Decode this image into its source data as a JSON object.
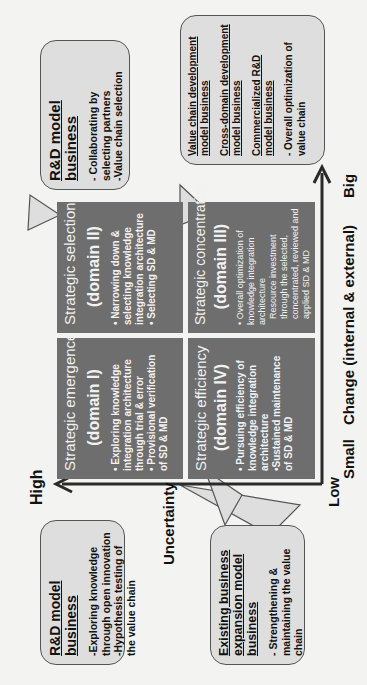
{
  "axes": {
    "y_axis": {
      "title": "Uncertainty",
      "high_label": "High",
      "low_label": "Low"
    },
    "x_axis": {
      "title": "Change (internal & external)",
      "small_label": "Small",
      "big_label": "Big"
    }
  },
  "domains": [
    {
      "id": "I",
      "title": "Strategic emergence",
      "subtitle": "(domain I)",
      "bullets": [
        "• Exploring knowledge integration architecture through trial & error",
        "• Provisional verification of SD & MD"
      ]
    },
    {
      "id": "II",
      "title": "Strategic selection",
      "subtitle": "(domain II)",
      "bullets": [
        "• Narrowing down & selecting knowledge integration architecture",
        "• Selecting SD & MD"
      ]
    },
    {
      "id": "III",
      "title": "Strategic concentration",
      "subtitle": "(domain III)",
      "bullets": [
        "• Overall optimization of knowledge integration architecture",
        "Resource investment through the selected, concentrated, reviewed and applied SD & MD"
      ]
    },
    {
      "id": "IV",
      "title": "Strategic efficiency",
      "subtitle": "(domain IV)",
      "bullets": [
        "• Pursuing efficiency of knowledge integration architecture",
        "•Sustained maintenance of SD & MD"
      ]
    }
  ],
  "callouts": {
    "domain_I": {
      "heading": "R&D model business",
      "lines": [
        "-Exploring knowledge through open innovation",
        "-Hypothesis testing of the value chain"
      ]
    },
    "domain_II": {
      "heading": "R&D model business",
      "lines": [
        "- Collaborating by selecting partners",
        "-Value chain selection"
      ]
    },
    "domain_III": {
      "underlined": [
        "Value chain development model business",
        "Cross-domain development model business",
        "Commercialized R&D model business"
      ],
      "lines": [
        "- Overall optimization of value chain"
      ]
    },
    "domain_IV": {
      "underlined": [
        "Existing business expansion model business"
      ],
      "lines": [
        "- Strengthening & maintaining the value chain"
      ]
    }
  },
  "colors": {
    "domain_fill": "#6e6e6e",
    "callout_fill": "#dedede",
    "axis": "#2a2a2a",
    "background": "#f3f3f1"
  }
}
